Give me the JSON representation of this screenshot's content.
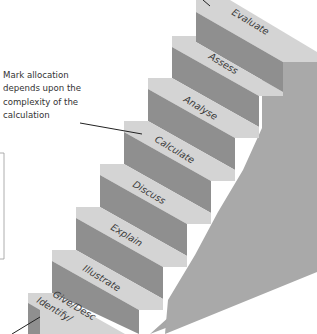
{
  "diagram": {
    "title": "",
    "type": "staircase",
    "steps": [
      {
        "label": "Give/Describe/Identify",
        "visible_label_line1": "Give/Desc",
        "visible_label_line2": "Identify/",
        "level": 1
      },
      {
        "label": "Illustrate",
        "level": 2
      },
      {
        "label": "Explain",
        "level": 3
      },
      {
        "label": "Discuss",
        "level": 4
      },
      {
        "label": "Calculate",
        "level": 5
      },
      {
        "label": "Analyse",
        "level": 6
      },
      {
        "label": "Assess",
        "level": 7
      },
      {
        "label": "Evaluate",
        "level": 8
      }
    ],
    "annotation": {
      "lines": [
        "Mark allocation",
        "depends upon the",
        "complexity of the",
        "calculation"
      ],
      "points_to": "Calculate"
    },
    "colors": {
      "tread": "#d2d2d2",
      "riser": "#8e8e8e",
      "side": "#a9a9a9",
      "text": "#333333",
      "leader_line": "#222222"
    }
  }
}
